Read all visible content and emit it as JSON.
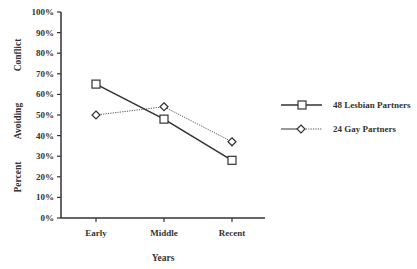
{
  "chart_data": {
    "type": "line",
    "title": "",
    "xlabel": "Years",
    "ylabel": "Percent Avoiding Conflict",
    "ylabel_parts": [
      "Percent",
      "Avoiding",
      "Conflict"
    ],
    "categories": [
      "Early",
      "Middle",
      "Recent"
    ],
    "ylim": [
      0,
      100
    ],
    "yticks": [
      "0%",
      "10%",
      "20%",
      "30%",
      "40%",
      "50%",
      "60%",
      "70%",
      "80%",
      "90%",
      "100%"
    ],
    "grid": false,
    "legend_position": "right",
    "series": [
      {
        "name": "48 Lesbian Partners",
        "marker": "square",
        "line": "solid",
        "values": [
          65,
          48,
          28
        ]
      },
      {
        "name": "24 Gay Partners",
        "marker": "diamond",
        "line": "dotted",
        "values": [
          50,
          54,
          37
        ]
      }
    ]
  }
}
